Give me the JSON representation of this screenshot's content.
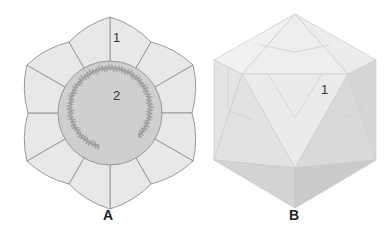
{
  "figures": [
    {
      "id": "A",
      "label": "A",
      "description": "Capsid subunit tiling: central pentagon-like disc surrounded by 12 outer tiles",
      "annotations": [
        {
          "text": "1",
          "target": "outer tile"
        },
        {
          "text": "2",
          "target": "central region with coiled genome"
        }
      ],
      "colors": {
        "outer_tile": "#e8e8e8",
        "center": "#cfcfcf",
        "edge": "#9a9a9a",
        "coil": "#a0a0a0"
      }
    },
    {
      "id": "B",
      "label": "B",
      "description": "Icosahedral capsid",
      "annotations": [
        {
          "text": "1",
          "target": "face"
        }
      ],
      "colors": {
        "light": "#f0f0f0",
        "mid": "#dedede",
        "dark": "#c8c8c8",
        "edge": "#bdbdbd"
      }
    }
  ]
}
